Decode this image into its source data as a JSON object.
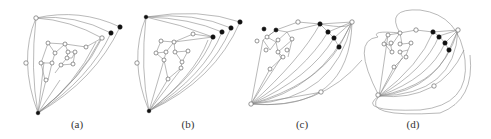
{
  "figure": {
    "panels": [
      {
        "id": "a",
        "caption": "(a)",
        "caption_x": 62
      },
      {
        "id": "b",
        "caption": "(b)",
        "caption_x": 173
      },
      {
        "id": "c",
        "caption": "(c)",
        "caption_x": 287
      },
      {
        "id": "d",
        "caption": "(d)",
        "caption_x": 398
      }
    ],
    "colors": {
      "edge": "#8a8a8a",
      "node_fill_white": "#ffffff",
      "node_fill_black": "#111111",
      "background": "#ffffff"
    }
  }
}
